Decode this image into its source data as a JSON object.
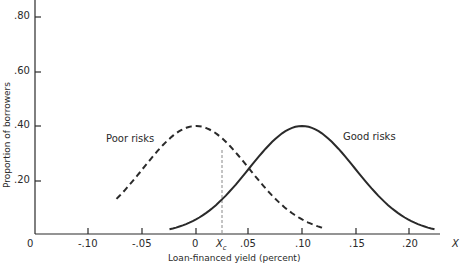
{
  "chart_data": {
    "type": "line",
    "title": "",
    "xlabel": "Loan-financed yield (partially visible)",
    "ylabel": "Proportion of borrowers",
    "x_axis_end_label": "X",
    "xlim": [
      -0.13,
      0.24
    ],
    "ylim": [
      0,
      0.85
    ],
    "x_ticks": [
      "-.10",
      "-.05",
      "0",
      "X_c",
      ".05",
      ".10",
      ".15",
      ".20"
    ],
    "y_ticks": [
      ".20",
      ".40",
      ".60",
      ".80"
    ],
    "origin_label": "0",
    "grid": false,
    "series": [
      {
        "name": "Poor risks",
        "style": "dashed",
        "mean": 0.0,
        "peak": 0.4,
        "x_range": [
          -0.075,
          0.12
        ]
      },
      {
        "name": "Good risks",
        "style": "solid",
        "mean": 0.1,
        "peak": 0.4,
        "x_range": [
          -0.025,
          0.225
        ]
      }
    ],
    "annotations": [
      {
        "label": "X_c",
        "x": 0.024,
        "type": "vertical-dashed-line"
      }
    ]
  },
  "labels": {
    "ylabel": "Proportion of borrowers",
    "poor": "Poor risks",
    "good": "Good risks",
    "origin": "0",
    "xend": "X",
    "xc": "X",
    "xc_sub": "c",
    "y80": ".80",
    "y60": ".60",
    "y40": ".40",
    "y20": ".20",
    "xm10": "-.10",
    "xm05": "-.05",
    "x0": "0",
    "x05": ".05",
    "x10": ".10",
    "x15": ".15",
    "x20": ".20",
    "xlabel": "Loan-financed yield (percent)"
  }
}
